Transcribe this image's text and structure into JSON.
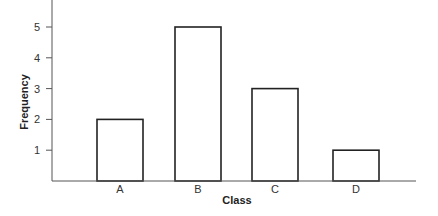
{
  "chart_data": {
    "type": "bar",
    "title": "",
    "xlabel": "Class",
    "ylabel": "Frequency",
    "categories": [
      "A",
      "B",
      "C",
      "D"
    ],
    "values": [
      2,
      5,
      3,
      1
    ],
    "yticks": [
      1,
      2,
      3,
      4,
      5
    ],
    "ylim": [
      0,
      5.8
    ],
    "grid": false,
    "legend": null,
    "colors": {
      "bar_fill": "#ffffff",
      "bar_stroke": "#222222",
      "axis": "#555555"
    }
  }
}
